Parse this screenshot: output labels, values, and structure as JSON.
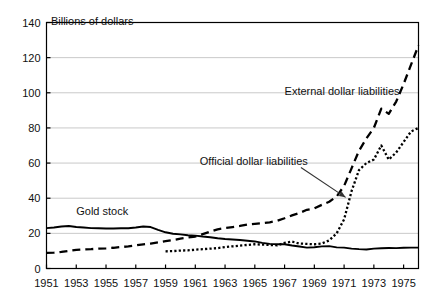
{
  "chart_data": {
    "type": "line",
    "title": "",
    "ylabel": "Billions of dollars",
    "xlabel": "",
    "ylim": [
      0,
      140
    ],
    "xlim": [
      1951,
      1976
    ],
    "grid": true,
    "legend_position": "inline-annotations",
    "yticks": [
      0,
      20,
      40,
      60,
      80,
      100,
      120,
      140
    ],
    "ytick_labels": [
      "0",
      "20",
      "40",
      "60",
      "80",
      "100",
      "120",
      "140"
    ],
    "xticks": [
      1951,
      1953,
      1955,
      1957,
      1959,
      1961,
      1963,
      1965,
      1967,
      1969,
      1971,
      1973,
      1975
    ],
    "xtick_labels": [
      "1951",
      "1953",
      "1955",
      "1957",
      "1959",
      "1961",
      "1963",
      "1965",
      "1967",
      "1969",
      "1971",
      "1973",
      "1975"
    ],
    "series": [
      {
        "name": "Gold stock",
        "style": "solid",
        "color": "#000000",
        "x": [
          1951.0,
          1951.5,
          1952.0,
          1952.5,
          1953.0,
          1953.5,
          1954.0,
          1954.5,
          1955.0,
          1955.5,
          1956.0,
          1956.5,
          1957.0,
          1957.5,
          1958.0,
          1958.5,
          1959.0,
          1959.5,
          1960.0,
          1960.5,
          1961.0,
          1961.5,
          1962.0,
          1962.5,
          1963.0,
          1963.5,
          1964.0,
          1964.5,
          1965.0,
          1965.5,
          1966.0,
          1966.5,
          1967.0,
          1967.5,
          1968.0,
          1968.5,
          1969.0,
          1969.5,
          1970.0,
          1970.5,
          1971.0,
          1971.5,
          1972.0,
          1972.5,
          1973.0,
          1973.5,
          1974.0,
          1974.5,
          1975.0,
          1975.5,
          1976.0
        ],
        "values": [
          23.0,
          23.3,
          23.9,
          24.2,
          23.6,
          23.3,
          23.0,
          22.9,
          22.8,
          22.8,
          22.9,
          22.9,
          23.3,
          23.9,
          23.6,
          22.0,
          20.6,
          19.8,
          19.4,
          18.9,
          18.7,
          18.2,
          17.8,
          17.2,
          16.8,
          16.5,
          16.2,
          15.8,
          15.4,
          14.6,
          14.0,
          13.8,
          13.8,
          13.1,
          12.5,
          11.9,
          12.1,
          12.6,
          12.7,
          12.0,
          11.9,
          11.3,
          11.0,
          10.8,
          11.3,
          11.5,
          11.7,
          11.6,
          11.8,
          11.9,
          11.9
        ]
      },
      {
        "name": "External dollar liabilities",
        "style": "dashed",
        "color": "#000000",
        "x": [
          1951.0,
          1951.5,
          1952.0,
          1952.5,
          1953.0,
          1953.5,
          1954.0,
          1954.5,
          1955.0,
          1955.5,
          1956.0,
          1956.5,
          1957.0,
          1957.5,
          1958.0,
          1958.5,
          1959.0,
          1959.5,
          1960.0,
          1960.5,
          1961.0,
          1961.5,
          1962.0,
          1962.5,
          1963.0,
          1963.5,
          1964.0,
          1964.5,
          1965.0,
          1965.5,
          1966.0,
          1966.5,
          1967.0,
          1967.5,
          1968.0,
          1968.5,
          1969.0,
          1969.5,
          1970.0,
          1970.5,
          1971.0,
          1971.5,
          1972.0,
          1972.5,
          1973.0,
          1973.5,
          1974.0,
          1974.5,
          1975.0,
          1975.5,
          1976.0
        ],
        "values": [
          8.9,
          9.0,
          9.4,
          10.0,
          10.6,
          10.8,
          11.0,
          11.3,
          11.5,
          11.8,
          12.2,
          12.6,
          13.2,
          13.7,
          14.2,
          14.9,
          15.6,
          16.2,
          17.0,
          17.6,
          18.2,
          19.6,
          21.0,
          22.3,
          23.0,
          23.6,
          24.2,
          25.0,
          25.4,
          25.8,
          26.3,
          27.2,
          28.6,
          30.2,
          31.6,
          33.4,
          34.2,
          36.2,
          38.0,
          41.0,
          47.0,
          57.0,
          67.0,
          74.0,
          80.0,
          91.0,
          88.0,
          95.0,
          105.0,
          116.0,
          127.0
        ]
      },
      {
        "name": "Official dollar liabilities",
        "style": "dotted",
        "color": "#000000",
        "x": [
          1959.0,
          1959.5,
          1960.0,
          1960.5,
          1961.0,
          1961.5,
          1962.0,
          1962.5,
          1963.0,
          1963.5,
          1964.0,
          1964.5,
          1965.0,
          1965.5,
          1966.0,
          1966.5,
          1967.0,
          1967.5,
          1968.0,
          1968.5,
          1969.0,
          1969.5,
          1970.0,
          1970.5,
          1971.0,
          1971.5,
          1972.0,
          1972.5,
          1973.0,
          1973.5,
          1974.0,
          1974.5,
          1975.0,
          1975.5,
          1976.0
        ],
        "values": [
          9.8,
          9.9,
          10.2,
          10.3,
          10.7,
          11.0,
          11.3,
          11.6,
          12.2,
          12.6,
          13.0,
          13.4,
          13.8,
          13.6,
          13.4,
          13.2,
          14.6,
          15.3,
          14.2,
          14.0,
          13.8,
          14.2,
          16.0,
          20.0,
          28.0,
          44.0,
          56.0,
          60.0,
          62.0,
          70.0,
          62.0,
          66.0,
          72.0,
          78.0,
          80.0
        ]
      }
    ],
    "annotations": [
      {
        "text": "Billions of dollars",
        "kind": "axis-title",
        "x": 1951.3,
        "y": 141
      },
      {
        "text": "Gold stock",
        "kind": "series-label",
        "x": 1953.0,
        "y": 33
      },
      {
        "text": "Official dollar liabilities",
        "kind": "series-label",
        "x": 1961.3,
        "y": 61,
        "arrow_from": [
          1968.1,
          57.5
        ],
        "arrow_to": [
          1971.1,
          40.5
        ]
      },
      {
        "text": "External dollar liabilities",
        "kind": "series-label",
        "x": 1967.0,
        "y": 101
      }
    ]
  }
}
